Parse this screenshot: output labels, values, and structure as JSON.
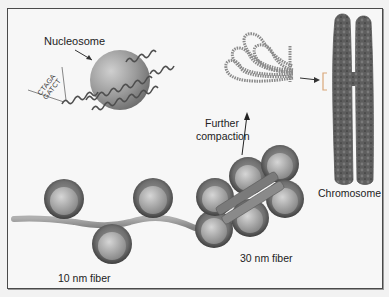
{
  "diagram": {
    "title": "",
    "labels": {
      "nucleosome": "Nucleosome",
      "further_compaction_line1": "Further",
      "further_compaction_line2": "compaction",
      "chromosome": "Chromosome",
      "fiber_10nm": "10 nm fiber",
      "fiber_30nm": "30 nm fiber"
    },
    "dna_sequence": {
      "top_strand": "CTAGA",
      "bottom_strand": "GATCT"
    },
    "colors": {
      "background": "#f7f7f7",
      "border": "#4a4a4a",
      "nucleosome_light": "#c8c8c8",
      "nucleosome_dark": "#6a6a6a",
      "dna_strand": "#555555",
      "chromosome": "#5a5a5a",
      "bracket": "#d9a77a",
      "fiber_linker": "#9a9a9a",
      "text": "#222222"
    },
    "elements": [
      {
        "name": "nucleosome",
        "description": "Histone core with DNA wrapped around"
      },
      {
        "name": "looped-chromatin",
        "description": "Looped domains of 30 nm fiber"
      },
      {
        "name": "chromosome",
        "description": "Condensed metaphase chromosome"
      },
      {
        "name": "10nm-fiber",
        "description": "Beads-on-a-string chromatin"
      },
      {
        "name": "30nm-fiber",
        "description": "Solenoid compacted fiber"
      }
    ]
  }
}
